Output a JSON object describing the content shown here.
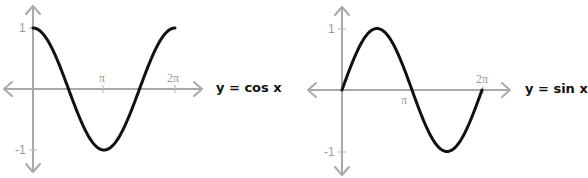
{
  "chart_data": [
    {
      "type": "line",
      "title": "y = cos x",
      "function": "cos",
      "xlabel": "",
      "ylabel": "",
      "x_ticks": [
        "π",
        "2π"
      ],
      "x_tick_values": [
        3.1416,
        6.2832
      ],
      "y_ticks": [
        "1",
        "-1"
      ],
      "y_tick_values": [
        1,
        -1
      ],
      "xlim": [
        0,
        6.2832
      ],
      "ylim": [
        -1,
        1
      ],
      "grid": false,
      "series": [
        {
          "name": "cos x",
          "x": [
            0,
            0.7854,
            1.5708,
            2.3562,
            3.1416,
            3.927,
            4.7124,
            5.4978,
            6.2832
          ],
          "values": [
            1,
            0.707,
            0,
            -0.707,
            -1,
            -0.707,
            0,
            0.707,
            1
          ]
        }
      ]
    },
    {
      "type": "line",
      "title": "y = sin x",
      "function": "sin",
      "xlabel": "",
      "ylabel": "",
      "x_ticks": [
        "π",
        "2π"
      ],
      "x_tick_values": [
        3.1416,
        6.2832
      ],
      "y_ticks": [
        "1",
        "-1"
      ],
      "y_tick_values": [
        1,
        -1
      ],
      "xlim": [
        0,
        6.2832
      ],
      "ylim": [
        -1,
        1
      ],
      "grid": false,
      "series": [
        {
          "name": "sin x",
          "x": [
            0,
            0.7854,
            1.5708,
            2.3562,
            3.1416,
            3.927,
            4.7124,
            5.4978,
            6.2832
          ],
          "values": [
            0,
            0.707,
            1,
            0.707,
            0,
            -0.707,
            -1,
            -0.707,
            0
          ]
        }
      ]
    }
  ],
  "left_chart": {
    "title": "y = cos x",
    "tick_pi": "π",
    "tick_2pi": "2π",
    "tick_pos1": "1",
    "tick_neg1": "-1"
  },
  "right_chart": {
    "title": "y = sin x",
    "tick_pi": "π",
    "tick_2pi": "2π",
    "tick_pos1": "1",
    "tick_neg1": "-1"
  },
  "colors": {
    "axis": "#a9a9a9",
    "curve": "#111111",
    "tick_label": "#9a9a9a"
  }
}
